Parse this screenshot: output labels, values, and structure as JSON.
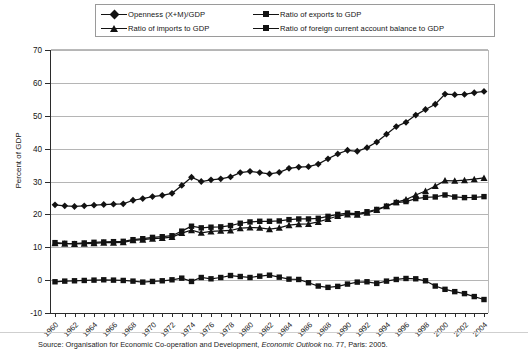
{
  "chart_data": {
    "type": "line",
    "title": "",
    "xlabel": "",
    "ylabel": "Percent of GDP",
    "ylim": [
      -10,
      70
    ],
    "ytick_step": 10,
    "yticks": [
      -10,
      0,
      10,
      20,
      30,
      40,
      50,
      60,
      70
    ],
    "grid": true,
    "legend_position": "top",
    "x": [
      1960,
      1961,
      1962,
      1963,
      1964,
      1965,
      1966,
      1967,
      1968,
      1969,
      1970,
      1971,
      1972,
      1973,
      1974,
      1975,
      1976,
      1977,
      1978,
      1979,
      1980,
      1981,
      1982,
      1983,
      1984,
      1985,
      1986,
      1987,
      1988,
      1989,
      1990,
      1991,
      1992,
      1993,
      1994,
      1995,
      1996,
      1997,
      1998,
      1999,
      2000,
      2001,
      2002,
      2003,
      2004
    ],
    "xtick_labels": [
      "1960",
      "1962",
      "1964",
      "1966",
      "1968",
      "1970",
      "1972",
      "1974",
      "1976",
      "1978",
      "1980",
      "1982",
      "1984",
      "1986",
      "1988",
      "1990",
      "1992",
      "1994",
      "1996",
      "1998",
      "2000",
      "2002",
      "2004"
    ],
    "series": [
      {
        "name": "Openness (X+M)/GDP",
        "marker": "diamond",
        "color": "#121212",
        "values": [
          22.9,
          22.6,
          22.4,
          22.6,
          22.8,
          23.0,
          23.1,
          23.2,
          24.3,
          24.8,
          25.4,
          25.8,
          26.4,
          28.8,
          31.3,
          30.0,
          30.5,
          30.8,
          31.4,
          32.7,
          33.1,
          32.7,
          32.3,
          32.8,
          34.0,
          34.4,
          34.5,
          35.3,
          36.9,
          38.4,
          39.5,
          39.2,
          40.3,
          42.0,
          44.4,
          46.7,
          48.0,
          50.2,
          51.9,
          53.5,
          56.6,
          56.4,
          56.5,
          57.0,
          57.4
        ]
      },
      {
        "name": "Ratio of exports to GDP",
        "marker": "square",
        "color": "#121212",
        "values": [
          11.4,
          11.2,
          11.1,
          11.3,
          11.5,
          11.6,
          11.7,
          11.8,
          12.3,
          12.6,
          13.0,
          13.2,
          13.5,
          14.9,
          16.4,
          15.9,
          16.1,
          16.2,
          16.6,
          17.3,
          17.7,
          17.9,
          17.9,
          18.0,
          18.4,
          18.6,
          18.6,
          18.8,
          19.4,
          20.0,
          20.4,
          20.2,
          20.8,
          21.5,
          22.5,
          23.6,
          23.9,
          24.8,
          25.2,
          25.3,
          25.9,
          25.3,
          25.1,
          25.2,
          25.4
        ]
      },
      {
        "name": "Ratio of imports to GDP",
        "marker": "triangle",
        "color": "#121212",
        "values": [
          11.2,
          11.1,
          11.0,
          11.1,
          11.2,
          11.4,
          11.4,
          11.5,
          12.1,
          12.3,
          12.6,
          12.8,
          13.1,
          14.3,
          15.2,
          14.4,
          14.8,
          15.0,
          15.1,
          15.8,
          16.0,
          15.9,
          15.5,
          15.9,
          16.7,
          17.0,
          17.1,
          17.7,
          18.6,
          19.5,
          20.0,
          19.9,
          20.5,
          21.3,
          22.5,
          23.7,
          24.5,
          25.9,
          27.1,
          28.6,
          30.3,
          30.2,
          30.4,
          30.7,
          31.1
        ]
      },
      {
        "name": "Ratio of foreign current account balance to GDP",
        "marker": "square",
        "color": "#121212",
        "values": [
          -0.5,
          -0.3,
          -0.2,
          -0.1,
          0.0,
          0.1,
          0.0,
          -0.1,
          -0.3,
          -0.6,
          -0.4,
          -0.2,
          0.1,
          0.6,
          -0.4,
          0.8,
          0.4,
          0.8,
          1.4,
          1.1,
          0.8,
          1.2,
          1.5,
          0.9,
          0.3,
          0.2,
          -0.8,
          -1.8,
          -2.2,
          -1.9,
          -1.2,
          -0.6,
          -0.5,
          -1.0,
          -0.3,
          0.2,
          0.5,
          0.4,
          -0.2,
          -1.8,
          -2.8,
          -3.5,
          -4.1,
          -5.0,
          -5.9
        ]
      }
    ]
  },
  "legend": {
    "entries": [
      {
        "label": "Openness (X+M)/GDP",
        "marker": "diamond"
      },
      {
        "label": "Ratio of exports to GDP",
        "marker": "square"
      },
      {
        "label": "Ratio of imports to GDP",
        "marker": "triangle"
      },
      {
        "label": "Ratio of foreign current account balance to GDP",
        "marker": "square"
      }
    ]
  },
  "axes": {
    "y_title": "Percent of GDP"
  },
  "footer": {
    "source_prefix": "Source: Organisation for Economic Co-operation and Development, ",
    "source_italic": "Economic Outlook",
    "source_suffix": " no. 77, Paris: 2005."
  },
  "colors": {
    "ink": "#121212",
    "gridline": "#b5b5b5",
    "axis": "#2b2b2b"
  }
}
